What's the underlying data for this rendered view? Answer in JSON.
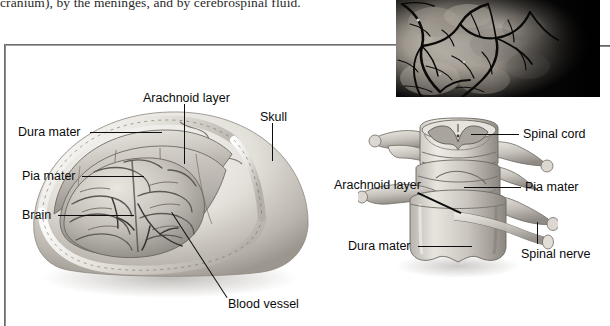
{
  "page": {
    "width": 610,
    "height": 326,
    "background": "#ffffff",
    "ink": "#0b0b0b"
  },
  "body_text": {
    "line": "cranium), by the meninges, and by cerebrospinal fluid."
  },
  "photo": {
    "caption_present": false,
    "subject": "brain-surface-blood-vessels-photograph",
    "background_color": "#050505",
    "tissue_color": "#b9b4ad"
  },
  "figures": [
    {
      "id": "brain-meninges",
      "name": "brain-cutaway-illustration",
      "labels": [
        {
          "id": "arachnoid-layer",
          "text": "Arachnoid layer",
          "x": 143,
          "y": 92
        },
        {
          "id": "skull",
          "text": "Skull",
          "x": 260,
          "y": 111
        },
        {
          "id": "dura-mater",
          "text": "Dura mater",
          "x": 18,
          "y": 126
        },
        {
          "id": "pia-mater",
          "text": "Pia mater",
          "x": 22,
          "y": 170
        },
        {
          "id": "brain",
          "text": "Brain",
          "x": 22,
          "y": 209
        },
        {
          "id": "blood-vessel",
          "text": "Blood vessel",
          "x": 228,
          "y": 298
        }
      ]
    },
    {
      "id": "spinal-meninges",
      "name": "vertebra-spinal-cord-illustration",
      "labels": [
        {
          "id": "spinal-cord",
          "text": "Spinal cord",
          "x": 523,
          "y": 128
        },
        {
          "id": "arachnoid-layer",
          "text": "Arachnoid layer",
          "x": 334,
          "y": 179
        },
        {
          "id": "pia-mater",
          "text": "Pia mater",
          "x": 525,
          "y": 181
        },
        {
          "id": "dura-mater",
          "text": "Dura mater",
          "x": 348,
          "y": 240
        },
        {
          "id": "spinal-nerve",
          "text": "Spinal nerve",
          "x": 521,
          "y": 248
        }
      ]
    }
  ],
  "colors": {
    "rule": "#5a5a5a",
    "label_text": "#0b0b0b",
    "leader_line": "#0d0d0d",
    "tissue_light": "#e6e3de",
    "tissue_mid": "#bdb9b2",
    "tissue_dark": "#8d8984",
    "bone_light": "#f2f0ec",
    "shadow": "#9a958e"
  }
}
